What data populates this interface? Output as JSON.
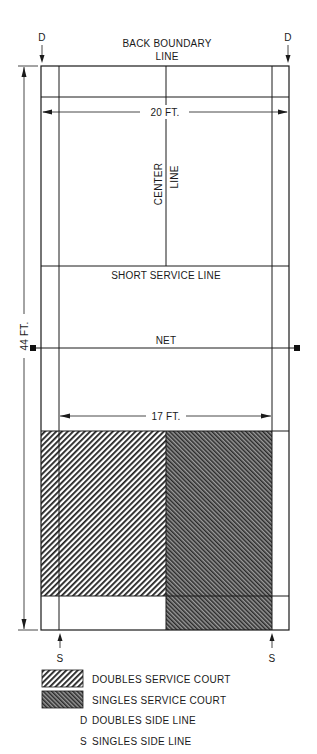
{
  "diagram": {
    "type": "badminton-court",
    "labels": {
      "back_boundary_line": [
        "BACK BOUNDARY",
        "LINE"
      ],
      "width_doubles": "20 FT.",
      "center_line": [
        "CENTER",
        "LINE"
      ],
      "short_service_line": "SHORT SERVICE LINE",
      "net": "NET",
      "width_singles": "17 FT.",
      "length": "44 FT.",
      "doubles_marker": "D",
      "singles_marker": "S"
    },
    "legend": [
      {
        "swatch": "doubles-hatch",
        "label": "DOUBLES SERVICE COURT"
      },
      {
        "swatch": "singles-hatch",
        "label": "SINGLES SERVICE COURT"
      },
      {
        "key": "D",
        "label": "DOUBLES SIDE LINE"
      },
      {
        "key": "S",
        "label": "SINGLES SIDE LINE"
      }
    ],
    "colors": {
      "line": "#1a1a1a",
      "background": "#ffffff"
    }
  }
}
